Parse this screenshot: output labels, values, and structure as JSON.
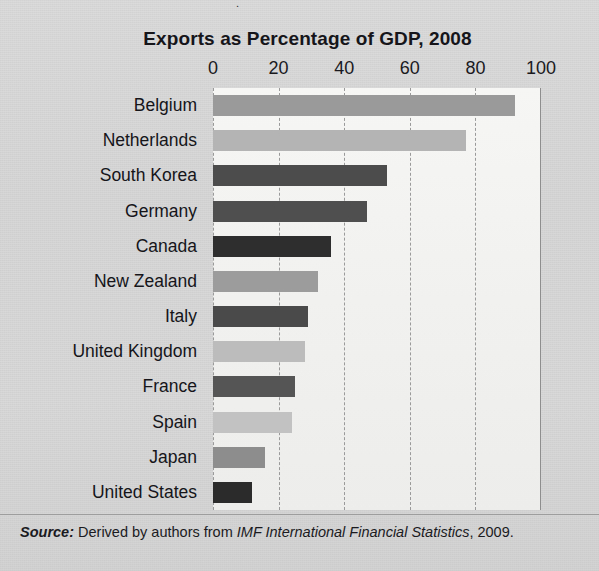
{
  "figure": {
    "title": "Exports as Percentage of GDP, 2008",
    "top_fragment": ".",
    "source_label": "Source:",
    "source_text_before": " Derived by authors from ",
    "source_italic": "IMF International Financial Statistics",
    "source_text_after": ", 2009."
  },
  "chart_data": {
    "type": "bar",
    "orientation": "horizontal",
    "title": "Exports as Percentage of GDP, 2008",
    "xlabel": "",
    "ylabel": "",
    "xlim": [
      0,
      100
    ],
    "xticks": [
      0,
      20,
      40,
      60,
      80,
      100
    ],
    "xtick_labels": [
      "0",
      "20",
      "40",
      "60",
      "80",
      "100"
    ],
    "grid": "vertical-dashed",
    "legend": "none",
    "categories": [
      "Belgium",
      "Netherlands",
      "South Korea",
      "Germany",
      "Canada",
      "New Zealand",
      "Italy",
      "United Kingdom",
      "France",
      "Spain",
      "Japan",
      "United States"
    ],
    "values": [
      92,
      77,
      53,
      47,
      36,
      32,
      29,
      28,
      25,
      24,
      16,
      12
    ],
    "bar_colors": [
      "#9a9a9a",
      "#b4b4b4",
      "#4c4c4c",
      "#4f4f4f",
      "#2e2e2e",
      "#9c9c9c",
      "#4a4a4a",
      "#bcbcbc",
      "#555555",
      "#c2c2c2",
      "#8d8d8d",
      "#2b2b2b"
    ]
  },
  "colors": {
    "page_background": "#d9d9d9",
    "plot_background": "#f3f3f1",
    "gridline": "#9a9a9a",
    "text": "#15151a"
  }
}
